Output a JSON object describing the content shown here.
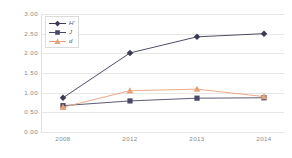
{
  "chart_data": {
    "type": "line",
    "title": "",
    "xlabel": "",
    "ylabel": "",
    "categories": [
      "2008",
      "2012",
      "2013",
      "2014"
    ],
    "ylim": [
      0.0,
      3.0
    ],
    "yticks": [
      "0.00",
      "0.50",
      "1.00",
      "1.50",
      "2.00",
      "2.50",
      "3.00"
    ],
    "ytick_values": [
      0.0,
      0.5,
      1.0,
      1.5,
      2.0,
      2.5,
      3.0
    ],
    "grid": "horizontal",
    "legend_position": "top-left",
    "series": [
      {
        "name": "H'",
        "marker": "diamond",
        "color": "#3a3a52",
        "values": [
          0.87,
          2.01,
          2.42,
          2.5
        ]
      },
      {
        "name": "J",
        "marker": "square",
        "color": "#4a4a66",
        "values": [
          0.67,
          0.79,
          0.86,
          0.87
        ]
      },
      {
        "name": "d",
        "marker": "triangle",
        "color": "#e8a07a",
        "values": [
          0.63,
          1.05,
          1.09,
          0.9
        ]
      }
    ]
  },
  "colors": {
    "background": "#ffffff",
    "gridline": "#e6e6e6",
    "axis": "#e0e0e0",
    "tick_text": "#8a8a8a",
    "legend_border": "#dcdcdc",
    "legend_text": "#555555"
  }
}
